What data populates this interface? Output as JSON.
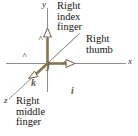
{
  "figure": {
    "width": 138,
    "height": 136,
    "background": "#ffffff",
    "axis_color": "#8a8a8a",
    "vector_color": "#8a7454",
    "text_color": "#141414",
    "vector_label_color": "#6b5b3e"
  },
  "axes": [
    {
      "name": "x",
      "label": "x",
      "direction": "right"
    },
    {
      "name": "y",
      "label": "y",
      "direction": "up"
    },
    {
      "name": "z",
      "label": "z",
      "direction": "down-left"
    }
  ],
  "vectors": [
    {
      "name": "i-hat",
      "label": "i",
      "hat": "^",
      "axis": "x",
      "color": "#8a7454"
    },
    {
      "name": "j-hat",
      "label": "j",
      "hat": "^",
      "axis": "y",
      "color": "#8a7454"
    },
    {
      "name": "k-hat",
      "label": "k",
      "hat": "^",
      "axis": "z",
      "color": "#8a7454"
    }
  ],
  "annotations": {
    "index_finger": "Right\nindex\nfinger",
    "thumb": "Right\nthumb",
    "middle_finger": "Right\nmiddle\nfinger"
  }
}
